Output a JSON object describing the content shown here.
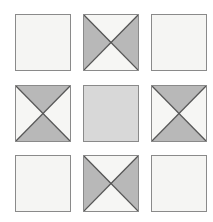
{
  "figure": {
    "title": "",
    "background_color": "#ffffff",
    "grid": {
      "rows": 3,
      "columns": 3,
      "cell_width_px": 56,
      "cell_height_px": 57,
      "border_color": "#8a8a8a",
      "diagonal_color": "#555555"
    },
    "colors": {
      "plain_light": "#f5f5f3",
      "plain_gray": "#d8d8d8",
      "triangle_gray": "#b8b8b8",
      "triangle_white": "#f6f6f4"
    },
    "cells": [
      {
        "position": "top-left",
        "row": 0,
        "column": 0,
        "pattern": "plain",
        "fill": "#f5f5f3",
        "has_diagonals": false,
        "shaded_triangles": []
      },
      {
        "position": "top-center",
        "row": 0,
        "column": 1,
        "pattern": "x-divided",
        "fill": "#f6f6f4",
        "has_diagonals": true,
        "shaded_triangles": [
          "left",
          "right"
        ]
      },
      {
        "position": "top-right",
        "row": 0,
        "column": 2,
        "pattern": "plain",
        "fill": "#f5f5f3",
        "has_diagonals": false,
        "shaded_triangles": []
      },
      {
        "position": "middle-left",
        "row": 1,
        "column": 0,
        "pattern": "x-divided",
        "fill": "#f6f6f4",
        "has_diagonals": true,
        "shaded_triangles": [
          "top",
          "bottom"
        ]
      },
      {
        "position": "middle-center",
        "row": 1,
        "column": 1,
        "pattern": "plain",
        "fill": "#d8d8d8",
        "has_diagonals": false,
        "shaded_triangles": []
      },
      {
        "position": "middle-right",
        "row": 1,
        "column": 2,
        "pattern": "x-divided",
        "fill": "#f6f6f4",
        "has_diagonals": true,
        "shaded_triangles": [
          "top",
          "bottom"
        ]
      },
      {
        "position": "bottom-left",
        "row": 2,
        "column": 0,
        "pattern": "plain",
        "fill": "#f5f5f3",
        "has_diagonals": false,
        "shaded_triangles": []
      },
      {
        "position": "bottom-center",
        "row": 2,
        "column": 1,
        "pattern": "x-divided",
        "fill": "#f6f6f4",
        "has_diagonals": true,
        "shaded_triangles": [
          "left",
          "right"
        ]
      },
      {
        "position": "bottom-right",
        "row": 2,
        "column": 2,
        "pattern": "plain",
        "fill": "#f5f5f3",
        "has_diagonals": false,
        "shaded_triangles": []
      }
    ]
  }
}
